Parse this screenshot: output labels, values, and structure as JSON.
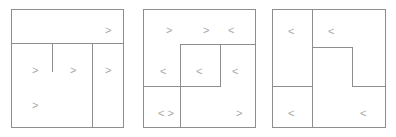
{
  "figure": {
    "title": "",
    "background_color": "#ffffff",
    "line_color": "#8d8d8d",
    "glyph_color": "#a8a8a8",
    "width": 396,
    "height": 137,
    "panel_count": 3
  },
  "panels": [
    {
      "id": "panel-1",
      "label": "",
      "box": {
        "x": 11,
        "y": 9,
        "w": 113,
        "h": 119
      },
      "segments": [
        {
          "name": "horizontal-divider-upper",
          "type": "h",
          "x": 11,
          "y": 43,
          "len": 113
        },
        {
          "name": "vertical-divider-right",
          "type": "v",
          "x": 92,
          "y": 43,
          "len": 85
        },
        {
          "name": "vertical-stub-center",
          "type": "v",
          "x": 52,
          "y": 43,
          "len": 29
        }
      ],
      "glyphs": [
        {
          "name": "arrow-top-right",
          "char": ">",
          "x": 105,
          "y": 25
        },
        {
          "name": "arrow-mid-left",
          "char": ">",
          "x": 32,
          "y": 65
        },
        {
          "name": "arrow-mid-center",
          "char": ">",
          "x": 70,
          "y": 65
        },
        {
          "name": "arrow-mid-right",
          "char": ">",
          "x": 105,
          "y": 65
        },
        {
          "name": "arrow-lower-left",
          "char": ">",
          "x": 32,
          "y": 100
        }
      ]
    },
    {
      "id": "panel-2",
      "label": "",
      "box": {
        "x": 143,
        "y": 9,
        "w": 113,
        "h": 119
      },
      "segments": [
        {
          "name": "horizontal-divider-upper-right",
          "type": "h",
          "x": 180,
          "y": 44,
          "len": 76
        },
        {
          "name": "vertical-divider-inner-left",
          "type": "v",
          "x": 180,
          "y": 44,
          "len": 43
        },
        {
          "name": "vertical-divider-inner-right",
          "type": "v",
          "x": 220,
          "y": 44,
          "len": 43
        },
        {
          "name": "horizontal-divider-lower-left",
          "type": "h",
          "x": 143,
          "y": 86,
          "len": 78
        },
        {
          "name": "vertical-divider-bottom",
          "type": "v",
          "x": 180,
          "y": 86,
          "len": 42
        }
      ],
      "glyphs": [
        {
          "name": "arrow-top-left",
          "char": ">",
          "x": 166,
          "y": 25
        },
        {
          "name": "arrow-top-center",
          "char": ">",
          "x": 203,
          "y": 25
        },
        {
          "name": "arrow-top-right",
          "char": "<",
          "x": 228,
          "y": 25
        },
        {
          "name": "arrow-mid-left",
          "char": "<",
          "x": 160,
          "y": 66
        },
        {
          "name": "arrow-mid-center",
          "char": "<",
          "x": 196,
          "y": 66
        },
        {
          "name": "arrow-mid-right",
          "char": "<",
          "x": 232,
          "y": 66
        },
        {
          "name": "arrow-pair-bottom-left",
          "char": "< >",
          "x": 158,
          "y": 108
        },
        {
          "name": "arrow-bottom-right",
          "char": ">",
          "x": 236,
          "y": 108
        }
      ]
    },
    {
      "id": "panel-3",
      "label": "",
      "box": {
        "x": 272,
        "y": 9,
        "w": 114,
        "h": 119
      },
      "segments": [
        {
          "name": "vertical-divider-main",
          "type": "v",
          "x": 312,
          "y": 9,
          "len": 119
        },
        {
          "name": "horizontal-notch-top",
          "type": "h",
          "x": 312,
          "y": 47,
          "len": 41
        },
        {
          "name": "vertical-notch-right",
          "type": "v",
          "x": 352,
          "y": 47,
          "len": 40
        },
        {
          "name": "horizontal-notch-bottom",
          "type": "h",
          "x": 352,
          "y": 86,
          "len": 34
        },
        {
          "name": "horizontal-divider-left",
          "type": "h",
          "x": 272,
          "y": 86,
          "len": 41
        }
      ],
      "glyphs": [
        {
          "name": "arrow-top-left",
          "char": "<",
          "x": 288,
          "y": 26
        },
        {
          "name": "arrow-top-center",
          "char": "<",
          "x": 328,
          "y": 26
        },
        {
          "name": "arrow-bottom-left",
          "char": "<",
          "x": 288,
          "y": 108
        },
        {
          "name": "arrow-bottom-right",
          "char": "<",
          "x": 360,
          "y": 108
        }
      ]
    }
  ]
}
